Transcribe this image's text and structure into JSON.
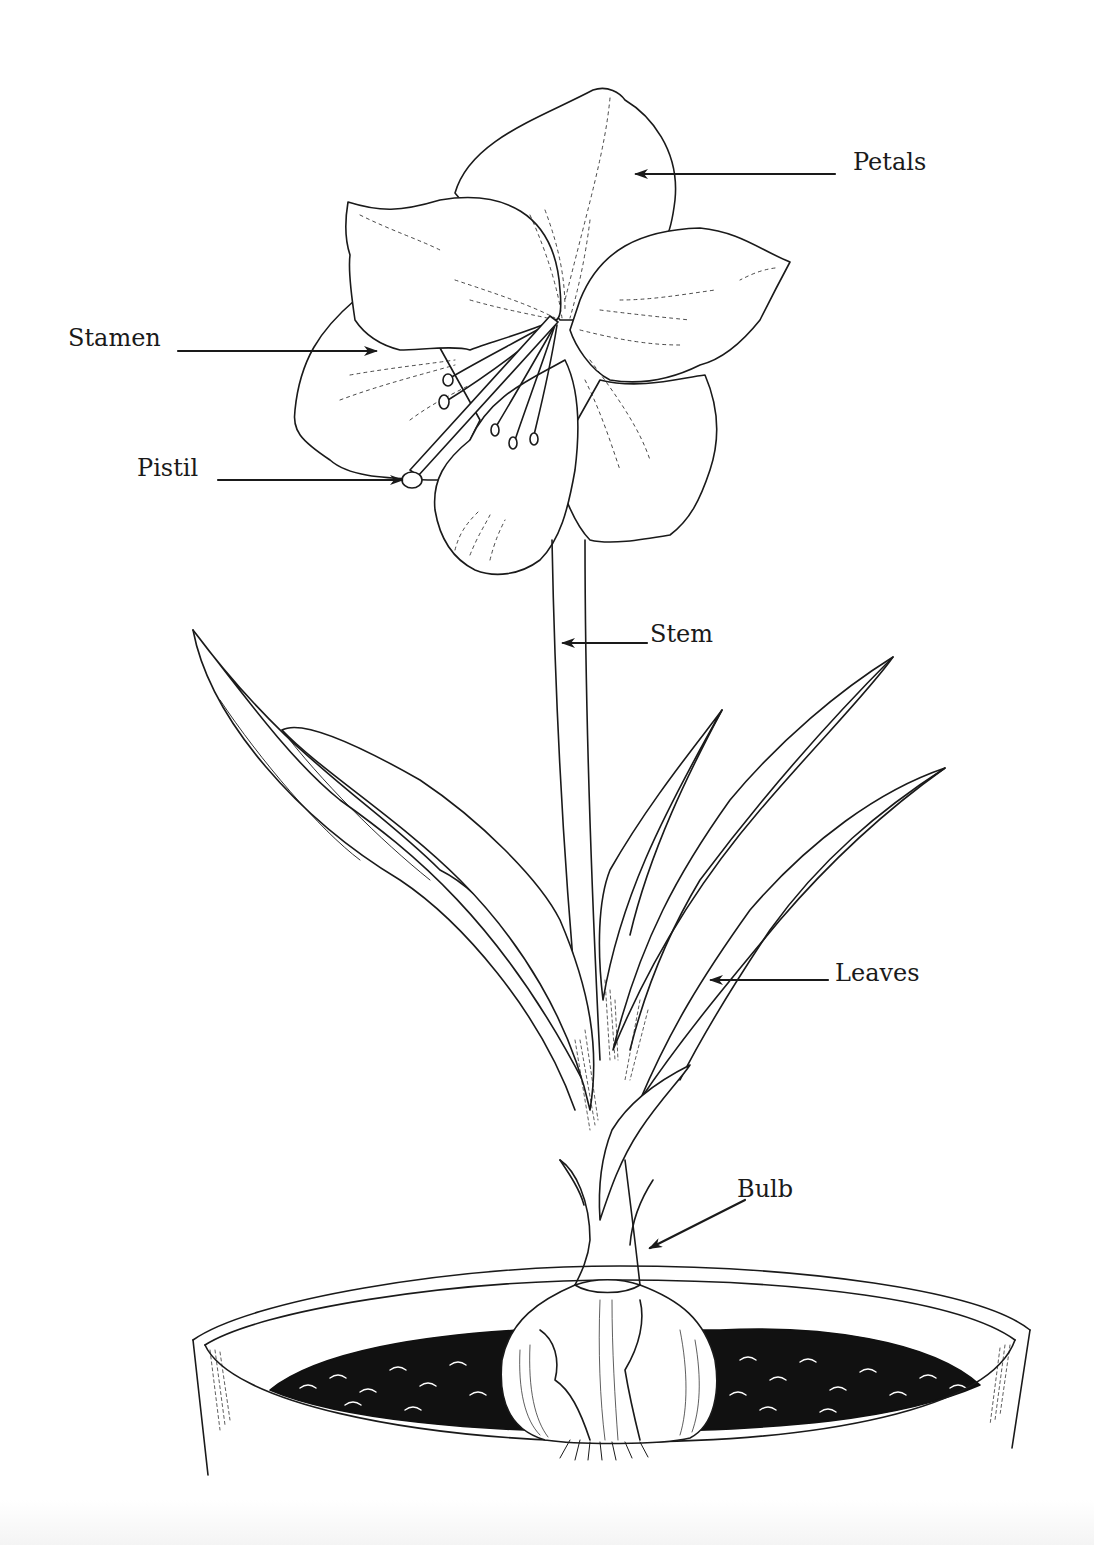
{
  "diagram": {
    "labels": {
      "petals": "Petals",
      "stamen": "Stamen",
      "pistil": "Pistil",
      "stem": "Stem",
      "leaves": "Leaves",
      "bulb": "Bulb"
    },
    "colors": {
      "ink": "#1a1a1a",
      "background": "#ffffff",
      "soil": "#111111"
    }
  }
}
